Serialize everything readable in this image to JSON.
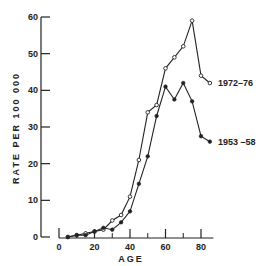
{
  "chart_data": {
    "type": "line",
    "title": "",
    "xlabel": "AGE",
    "ylabel": "RATE  PER  100 000",
    "xlim": [
      0,
      85
    ],
    "ylim": [
      0,
      60
    ],
    "x_ticks": [
      0,
      20,
      40,
      60,
      80
    ],
    "x_minor_ticks": [
      10,
      30,
      50,
      70
    ],
    "y_ticks": [
      0,
      10,
      20,
      30,
      40,
      50,
      60
    ],
    "grid": false,
    "legend_position": "inline labels at line ends (right)",
    "x": [
      5,
      10,
      15,
      20,
      25,
      30,
      35,
      40,
      45,
      50,
      55,
      60,
      65,
      70,
      75,
      80,
      85
    ],
    "series": [
      {
        "name": "1972-76",
        "label": "1972–76",
        "marker": "open-circle",
        "values": [
          0,
          0.5,
          1,
          1.5,
          2,
          4.5,
          6,
          11,
          21,
          34,
          36,
          46,
          49,
          52,
          59,
          44,
          42
        ]
      },
      {
        "name": "1953-58",
        "label": "1953 –58",
        "marker": "filled-circle",
        "values": [
          0,
          0.5,
          0.5,
          1.5,
          2.5,
          2,
          4,
          7,
          14.5,
          22,
          33,
          41,
          37.5,
          42,
          37,
          27.5,
          26
        ]
      }
    ]
  }
}
